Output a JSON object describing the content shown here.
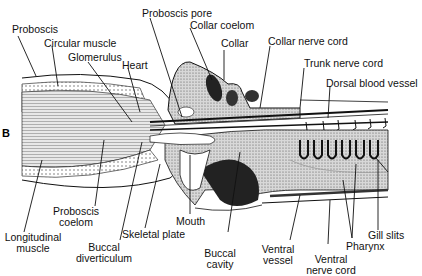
{
  "panel_label": "B",
  "labels": {
    "proboscis": "Proboscis",
    "circular_muscle": "Circular muscle",
    "glomerulus": "Glomerulus",
    "heart": "Heart",
    "proboscis_pore": "Proboscis pore",
    "collar_coelom": "Collar coelom",
    "collar": "Collar",
    "collar_nerve_cord": "Collar nerve cord",
    "trunk_nerve_cord": "Trunk nerve cord",
    "dorsal_blood_vessel": "Dorsal blood vessel",
    "proboscis_coelom_1": "Proboscis",
    "proboscis_coelom_2": "coelom",
    "longitudinal_muscle_1": "Longitudinal",
    "longitudinal_muscle_2": "muscle",
    "buccal_diverticulum_1": "Buccal",
    "buccal_diverticulum_2": "diverticulum",
    "skeletal_plate": "Skeletal plate",
    "mouth": "Mouth",
    "buccal_cavity_1": "Buccal",
    "buccal_cavity_2": "cavity",
    "ventral_vessel_1": "Ventral",
    "ventral_vessel_2": "vessel",
    "ventral_nerve_cord_1": "Ventral",
    "ventral_nerve_cord_2": "nerve cord",
    "pharynx": "Pharynx",
    "gill_slits": "Gill slits"
  },
  "colors": {
    "ink": "#111111",
    "stipple": "#9a9a9a",
    "muscle": "#c8c8c8"
  }
}
